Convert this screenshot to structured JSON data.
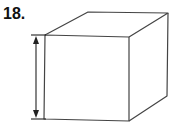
{
  "problem": {
    "number_label": "18."
  },
  "figure": {
    "type": "cube",
    "stroke_color": "#444444",
    "front_face": [
      [
        45,
        35
      ],
      [
        129,
        37
      ],
      [
        129,
        121
      ],
      [
        44,
        119
      ]
    ],
    "back_top_left": [
      88,
      12
    ],
    "back_top_right": [
      168,
      13
    ],
    "back_bottom_right": [
      167,
      96
    ],
    "dimension_arrow": {
      "x": 35,
      "y_top": 35,
      "y_bottom": 119,
      "tick_x1": 31,
      "tick_x2": 46
    }
  }
}
